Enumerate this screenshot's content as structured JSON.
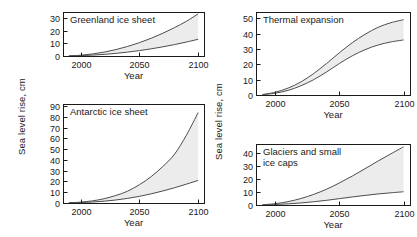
{
  "figure": {
    "axis_label_y_left": "Sea level rise, cm",
    "axis_label_y_right": "Sea level rise, cm",
    "ink_color": "#1a1a1a",
    "band_fill_color": "#ececec",
    "curve_color": "#4d4d4d",
    "background_color": "#ffffff"
  },
  "chart_data": [
    {
      "type": "area",
      "id": "greenland",
      "title": "Greenland ice sheet",
      "title_lines": [
        "Greenland ice sheet"
      ],
      "xlabel": "Year",
      "ylabel": "Sea level rise, cm",
      "xlim": [
        1985,
        2105
      ],
      "ylim": [
        0,
        35
      ],
      "xticks": [
        2000,
        2050,
        2100
      ],
      "xtick_labels": [
        "2000",
        "2050",
        "2100"
      ],
      "yticks": [
        0,
        10,
        20,
        30
      ],
      "ytick_labels": [
        "0",
        "10",
        "20",
        "30"
      ],
      "grid": false,
      "legend": "none",
      "x": [
        1990,
        2000,
        2010,
        2020,
        2030,
        2040,
        2050,
        2060,
        2070,
        2080,
        2090,
        2100
      ],
      "series": [
        {
          "name": "upper bound",
          "values": [
            0.1,
            0.6,
            1.6,
            3.1,
            5.1,
            7.6,
            10.6,
            14.1,
            18.1,
            22.6,
            27.6,
            33.5
          ]
        },
        {
          "name": "lower bound",
          "values": [
            0.05,
            0.3,
            0.7,
            1.3,
            2.1,
            3.1,
            4.3,
            5.7,
            7.3,
            9.1,
            11.1,
            13.3
          ]
        }
      ]
    },
    {
      "type": "area",
      "id": "antarctic",
      "title": "Antarctic ice sheet",
      "title_lines": [
        "Antarctic ice sheet"
      ],
      "xlabel": "Year",
      "ylabel": "Sea level rise, cm",
      "xlim": [
        1985,
        2105
      ],
      "ylim": [
        0,
        92
      ],
      "xticks": [
        2000,
        2050,
        2100
      ],
      "xtick_labels": [
        "2000",
        "2050",
        "2100"
      ],
      "yticks": [
        0,
        10,
        20,
        30,
        40,
        50,
        60,
        70,
        80,
        90
      ],
      "ytick_labels": [
        "0",
        "10",
        "20",
        "30",
        "40",
        "50",
        "60",
        "70",
        "80",
        "90"
      ],
      "grid": false,
      "legend": "none",
      "x": [
        1990,
        2000,
        2010,
        2020,
        2030,
        2040,
        2050,
        2060,
        2070,
        2080,
        2090,
        2100
      ],
      "series": [
        {
          "name": "upper bound",
          "values": [
            0.2,
            0.8,
            2.0,
            4.0,
            7.0,
            11.0,
            17.0,
            24.5,
            34.0,
            45.5,
            63.0,
            84.0
          ]
        },
        {
          "name": "lower bound",
          "values": [
            0.1,
            0.4,
            0.9,
            1.7,
            2.8,
            4.3,
            6.2,
            8.5,
            11.2,
            14.2,
            17.5,
            21.0
          ]
        }
      ]
    },
    {
      "type": "area",
      "id": "thermal-expansion",
      "title": "Thermal expansion",
      "title_lines": [
        "Thermal expansion"
      ],
      "xlabel": "Year",
      "ylabel": "Sea level rise, cm",
      "xlim": [
        1985,
        2105
      ],
      "ylim": [
        0,
        54
      ],
      "xticks": [
        2000,
        2050,
        2100
      ],
      "xtick_labels": [
        "2000",
        "2050",
        "2100"
      ],
      "yticks": [
        0,
        10,
        20,
        30,
        40,
        50
      ],
      "ytick_labels": [
        "0",
        "10",
        "20",
        "30",
        "40",
        "50"
      ],
      "grid": false,
      "legend": "none",
      "x": [
        1990,
        2000,
        2010,
        2020,
        2030,
        2040,
        2050,
        2060,
        2070,
        2080,
        2090,
        2100
      ],
      "series": [
        {
          "name": "upper bound",
          "values": [
            0.3,
            1.8,
            4.5,
            8.5,
            14.0,
            20.5,
            27.5,
            34.0,
            39.5,
            44.0,
            47.0,
            49.0
          ]
        },
        {
          "name": "lower bound",
          "values": [
            0.2,
            1.2,
            3.0,
            6.0,
            10.0,
            15.0,
            20.5,
            25.5,
            29.5,
            32.5,
            34.5,
            35.8
          ]
        }
      ]
    },
    {
      "type": "area",
      "id": "glaciers-small-ice-caps",
      "title": "Glaciers and small ice caps",
      "title_lines": [
        "Glaciers and small",
        "ice caps"
      ],
      "xlabel": "Year",
      "ylabel": "Sea level rise, cm",
      "xlim": [
        1985,
        2105
      ],
      "ylim": [
        0,
        47
      ],
      "xticks": [
        2000,
        2050,
        2100
      ],
      "xtick_labels": [
        "2000",
        "2050",
        "2100"
      ],
      "yticks": [
        0,
        10,
        20,
        30,
        40
      ],
      "ytick_labels": [
        "0",
        "10",
        "20",
        "30",
        "40"
      ],
      "grid": false,
      "legend": "none",
      "x": [
        1990,
        2000,
        2010,
        2020,
        2030,
        2040,
        2050,
        2060,
        2070,
        2080,
        2090,
        2100
      ],
      "series": [
        {
          "name": "upper bound",
          "values": [
            0.2,
            1.0,
            2.6,
            5.0,
            8.2,
            12.2,
            17.0,
            22.3,
            28.0,
            33.8,
            39.4,
            44.8
          ]
        },
        {
          "name": "lower bound",
          "values": [
            0.1,
            0.4,
            0.9,
            1.6,
            2.5,
            3.6,
            4.9,
            6.2,
            7.4,
            8.5,
            9.4,
            10.2
          ]
        }
      ]
    }
  ]
}
